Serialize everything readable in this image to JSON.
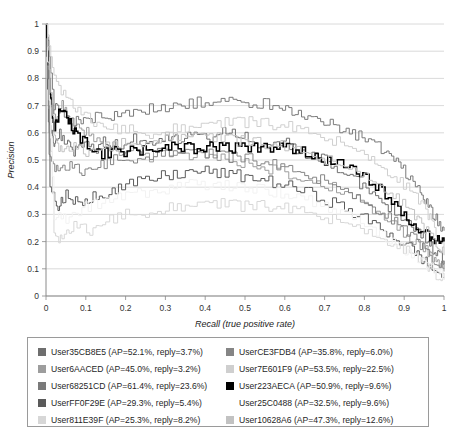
{
  "chart_data": {
    "type": "line",
    "title": "",
    "xlabel": "Recall (true positive rate)",
    "ylabel": "Precision",
    "xlim": [
      0,
      1
    ],
    "ylim": [
      0,
      1
    ],
    "grid": "horizontal",
    "legend_position": "bottom",
    "x_ticks": [
      "0",
      "0.1",
      "0.2",
      "0.3",
      "0.4",
      "0.5",
      "0.6",
      "0.7",
      "0.8",
      "0.9",
      "1"
    ],
    "y_ticks": [
      "0",
      "0.1",
      "0.2",
      "0.3",
      "0.4",
      "0.5",
      "0.6",
      "0.7",
      "0.8",
      "0.9",
      "1"
    ],
    "series": [
      {
        "name": "User35CB8E5",
        "label": "User35CB8E5 (AP=52.1%, reply=3.7%)",
        "ap": 52.1,
        "reply": 3.7,
        "color": "#6e6e6e",
        "x": [
          0.0,
          0.01,
          0.02,
          0.03,
          0.05,
          0.07,
          0.09,
          0.12,
          0.15,
          0.18,
          0.22,
          0.26,
          0.3,
          0.34,
          0.38,
          0.42,
          0.46,
          0.5,
          0.54,
          0.58,
          0.62,
          0.66,
          0.7,
          0.74,
          0.78,
          0.82,
          0.86,
          0.9,
          0.93,
          0.96,
          0.98,
          1.0
        ],
        "y": [
          1.0,
          0.62,
          0.55,
          0.6,
          0.57,
          0.53,
          0.56,
          0.54,
          0.57,
          0.55,
          0.58,
          0.56,
          0.59,
          0.57,
          0.6,
          0.58,
          0.61,
          0.59,
          0.56,
          0.58,
          0.55,
          0.52,
          0.5,
          0.46,
          0.42,
          0.38,
          0.33,
          0.28,
          0.24,
          0.2,
          0.16,
          0.13
        ]
      },
      {
        "name": "User6AACED",
        "label": "User6AACED (AP=45.0%, reply=3.2%)",
        "ap": 45.0,
        "reply": 3.2,
        "color": "#9d9d9d",
        "x": [
          0.0,
          0.01,
          0.02,
          0.04,
          0.06,
          0.09,
          0.12,
          0.16,
          0.2,
          0.25,
          0.3,
          0.35,
          0.4,
          0.45,
          0.5,
          0.55,
          0.6,
          0.65,
          0.7,
          0.75,
          0.8,
          0.85,
          0.89,
          0.93,
          0.96,
          0.98,
          1.0
        ],
        "y": [
          1.0,
          0.72,
          0.66,
          0.7,
          0.64,
          0.61,
          0.58,
          0.55,
          0.53,
          0.51,
          0.53,
          0.51,
          0.52,
          0.5,
          0.49,
          0.47,
          0.45,
          0.43,
          0.41,
          0.38,
          0.34,
          0.29,
          0.24,
          0.2,
          0.16,
          0.12,
          0.09
        ]
      },
      {
        "name": "User68251CD",
        "label": "User68251CD (AP=61.4%, reply=23.6%)",
        "ap": 61.4,
        "reply": 23.6,
        "color": "#7a7a7a",
        "x": [
          0.0,
          0.02,
          0.04,
          0.07,
          0.1,
          0.14,
          0.18,
          0.23,
          0.28,
          0.33,
          0.38,
          0.43,
          0.48,
          0.53,
          0.57,
          0.61,
          0.65,
          0.69,
          0.73,
          0.77,
          0.81,
          0.85,
          0.88,
          0.91,
          0.94,
          0.96,
          0.98,
          1.0
        ],
        "y": [
          1.0,
          0.7,
          0.66,
          0.64,
          0.65,
          0.66,
          0.67,
          0.68,
          0.69,
          0.7,
          0.71,
          0.72,
          0.72,
          0.71,
          0.7,
          0.68,
          0.66,
          0.64,
          0.62,
          0.6,
          0.57,
          0.53,
          0.49,
          0.44,
          0.38,
          0.33,
          0.28,
          0.24
        ]
      },
      {
        "name": "UserFF0F29E",
        "label": "UserFF0F29E (AP=29.3%, reply=5.4%)",
        "ap": 29.3,
        "reply": 5.4,
        "color": "#5a5a5a",
        "x": [
          0.0,
          0.01,
          0.03,
          0.05,
          0.08,
          0.11,
          0.15,
          0.19,
          0.24,
          0.29,
          0.34,
          0.39,
          0.44,
          0.49,
          0.54,
          0.59,
          0.64,
          0.69,
          0.74,
          0.79,
          0.84,
          0.88,
          0.92,
          0.95,
          0.97,
          1.0
        ],
        "y": [
          1.0,
          0.4,
          0.33,
          0.37,
          0.34,
          0.36,
          0.38,
          0.4,
          0.42,
          0.44,
          0.45,
          0.46,
          0.45,
          0.44,
          0.43,
          0.41,
          0.39,
          0.36,
          0.33,
          0.29,
          0.25,
          0.21,
          0.17,
          0.13,
          0.1,
          0.07
        ]
      },
      {
        "name": "User811E39F",
        "label": "User811E39F (AP=25.3%, reply=8.2%)",
        "ap": 25.3,
        "reply": 8.2,
        "color": "#d7d7d7",
        "x": [
          0.0,
          0.02,
          0.04,
          0.07,
          0.11,
          0.15,
          0.2,
          0.25,
          0.3,
          0.35,
          0.4,
          0.45,
          0.5,
          0.55,
          0.6,
          0.65,
          0.7,
          0.75,
          0.8,
          0.85,
          0.89,
          0.93,
          0.96,
          0.98,
          1.0
        ],
        "y": [
          1.0,
          0.22,
          0.2,
          0.26,
          0.24,
          0.28,
          0.3,
          0.31,
          0.32,
          0.33,
          0.34,
          0.34,
          0.33,
          0.33,
          0.32,
          0.31,
          0.29,
          0.27,
          0.24,
          0.21,
          0.18,
          0.14,
          0.11,
          0.08,
          0.06
        ]
      },
      {
        "name": "UserCE3FDB4",
        "label": "UserCE3FDB4 (AP=35.8%, reply=6.0%)",
        "ap": 35.8,
        "reply": 6.0,
        "color": "#858585",
        "x": [
          0.0,
          0.01,
          0.03,
          0.06,
          0.09,
          0.13,
          0.17,
          0.22,
          0.27,
          0.32,
          0.37,
          0.42,
          0.47,
          0.52,
          0.57,
          0.62,
          0.67,
          0.72,
          0.77,
          0.82,
          0.86,
          0.9,
          0.94,
          0.97,
          1.0
        ],
        "y": [
          1.0,
          0.5,
          0.45,
          0.48,
          0.46,
          0.48,
          0.5,
          0.51,
          0.52,
          0.53,
          0.53,
          0.52,
          0.51,
          0.5,
          0.48,
          0.46,
          0.44,
          0.41,
          0.37,
          0.33,
          0.29,
          0.24,
          0.19,
          0.14,
          0.1
        ]
      },
      {
        "name": "User7E601F9",
        "label": "User7E601F9 (AP=53.5%, reply=22.5%)",
        "ap": 53.5,
        "reply": 22.5,
        "color": "#cfcfcf",
        "x": [
          0.0,
          0.02,
          0.05,
          0.08,
          0.12,
          0.16,
          0.21,
          0.26,
          0.31,
          0.36,
          0.41,
          0.46,
          0.51,
          0.56,
          0.61,
          0.66,
          0.71,
          0.76,
          0.81,
          0.85,
          0.89,
          0.93,
          0.96,
          0.98,
          1.0
        ],
        "y": [
          1.0,
          0.8,
          0.72,
          0.68,
          0.64,
          0.62,
          0.61,
          0.6,
          0.61,
          0.62,
          0.63,
          0.64,
          0.64,
          0.63,
          0.62,
          0.6,
          0.58,
          0.55,
          0.51,
          0.47,
          0.42,
          0.36,
          0.3,
          0.24,
          0.18
        ]
      },
      {
        "name": "User223AECA",
        "label": "User223AECA (AP=50.9%, reply=9.6%)",
        "ap": 50.9,
        "reply": 9.6,
        "color": "#000000",
        "x": [
          0.0,
          0.01,
          0.02,
          0.04,
          0.06,
          0.08,
          0.11,
          0.14,
          0.18,
          0.22,
          0.26,
          0.3,
          0.34,
          0.38,
          0.42,
          0.46,
          0.5,
          0.54,
          0.58,
          0.62,
          0.66,
          0.7,
          0.74,
          0.78,
          0.82,
          0.86,
          0.9,
          0.93,
          0.96,
          0.98,
          1.0
        ],
        "y": [
          1.0,
          0.75,
          0.62,
          0.7,
          0.64,
          0.58,
          0.55,
          0.52,
          0.53,
          0.54,
          0.53,
          0.54,
          0.55,
          0.54,
          0.55,
          0.54,
          0.55,
          0.54,
          0.55,
          0.54,
          0.52,
          0.5,
          0.48,
          0.45,
          0.42,
          0.36,
          0.3,
          0.25,
          0.22,
          0.2,
          0.2
        ]
      },
      {
        "name": "User25C0488",
        "label": "User25C0488 (AP=32.5%, reply=9.6%)",
        "ap": 32.5,
        "reply": 9.6,
        "color": "#ffffff",
        "x": [
          0.0,
          0.02,
          0.05,
          0.09,
          0.13,
          0.18,
          0.23,
          0.28,
          0.33,
          0.38,
          0.43,
          0.48,
          0.53,
          0.58,
          0.63,
          0.68,
          0.73,
          0.78,
          0.83,
          0.87,
          0.91,
          0.95,
          0.98,
          1.0
        ],
        "y": [
          1.0,
          0.3,
          0.28,
          0.32,
          0.34,
          0.36,
          0.38,
          0.39,
          0.4,
          0.41,
          0.41,
          0.4,
          0.39,
          0.38,
          0.36,
          0.34,
          0.31,
          0.28,
          0.24,
          0.2,
          0.16,
          0.12,
          0.09,
          0.07
        ]
      },
      {
        "name": "User10628A6",
        "label": "User10628A6 (AP=47.3%, reply=12.6%)",
        "ap": 47.3,
        "reply": 12.6,
        "color": "#c2c2c2",
        "x": [
          0.0,
          0.02,
          0.04,
          0.07,
          0.1,
          0.14,
          0.19,
          0.24,
          0.29,
          0.34,
          0.39,
          0.44,
          0.49,
          0.54,
          0.59,
          0.64,
          0.69,
          0.74,
          0.79,
          0.84,
          0.88,
          0.92,
          0.95,
          0.98,
          1.0
        ],
        "y": [
          1.0,
          0.58,
          0.52,
          0.55,
          0.53,
          0.55,
          0.56,
          0.57,
          0.58,
          0.59,
          0.59,
          0.58,
          0.57,
          0.56,
          0.55,
          0.53,
          0.51,
          0.48,
          0.45,
          0.41,
          0.36,
          0.3,
          0.25,
          0.2,
          0.15
        ]
      }
    ]
  },
  "legend": {
    "columns": [
      {
        "items": [
          0,
          1,
          2,
          3,
          4
        ]
      },
      {
        "items": [
          5,
          6,
          7,
          8,
          9
        ]
      }
    ]
  }
}
